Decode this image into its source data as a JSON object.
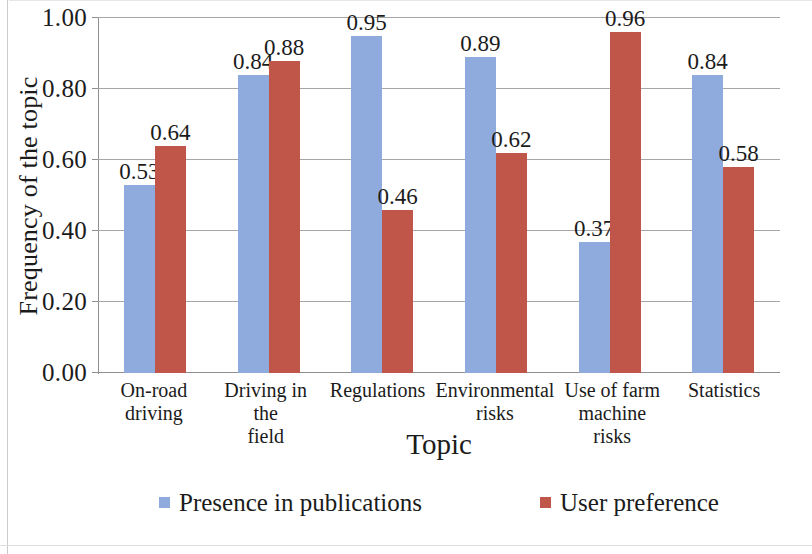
{
  "chart_data": {
    "type": "bar",
    "title": "",
    "xlabel": "Topic",
    "ylabel": "Frequency of the topic",
    "ylim": [
      0,
      1.0
    ],
    "ytick_labels": [
      "1.00",
      "0.80",
      "0.60",
      "0.40",
      "0.20",
      "0.00"
    ],
    "ytick_values": [
      1.0,
      0.8,
      0.6,
      0.4,
      0.2,
      0.0
    ],
    "grid": true,
    "legend_position": "bottom",
    "categories": [
      "On-road driving",
      "Driving in the field",
      "Regulations",
      "Environmental risks",
      "Use of farm machine risks",
      "Statistics"
    ],
    "category_lines": [
      [
        "On-road",
        "driving"
      ],
      [
        "Driving in the",
        "field"
      ],
      [
        "Regulations"
      ],
      [
        "Environmental",
        "risks"
      ],
      [
        "Use of farm",
        "machine risks"
      ],
      [
        "Statistics"
      ]
    ],
    "series": [
      {
        "name": "Presence in publications",
        "color": "#8faadc",
        "values": [
          0.53,
          0.84,
          0.95,
          0.89,
          0.37,
          0.84
        ],
        "labels": [
          "0.53",
          "0.84",
          "0.95",
          "0.89",
          "0.37",
          "0.84"
        ]
      },
      {
        "name": "User preference",
        "color": "#c0564a",
        "values": [
          0.64,
          0.88,
          0.46,
          0.62,
          0.96,
          0.58
        ],
        "labels": [
          "0.64",
          "0.88",
          "0.46",
          "0.62",
          "0.96",
          "0.58"
        ]
      }
    ]
  }
}
